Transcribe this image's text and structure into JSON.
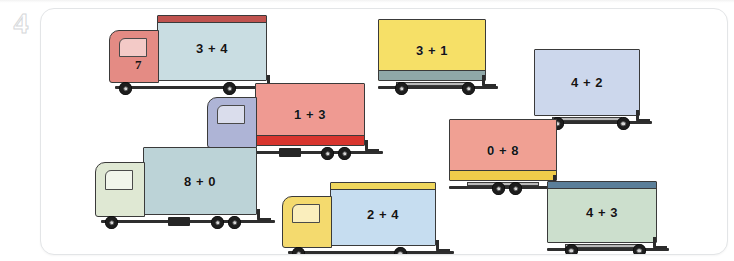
{
  "exercise": {
    "number": "4"
  },
  "worksheet": {
    "title": "Trucks with addition expressions",
    "vehicles": [
      {
        "id": "truck-3-plus-4",
        "kind": "truck",
        "expression": "3 + 4",
        "cab_number": "7",
        "cab_color": "#e48b84",
        "body_color": "#c9dde2",
        "band_color": "#c0534f",
        "band_position": "top",
        "x": 108,
        "y": 14,
        "width": 176,
        "height": 66
      },
      {
        "id": "trailer-3-plus-1",
        "kind": "trailer",
        "expression": "3 + 1",
        "cab_number": "",
        "cab_color": "",
        "body_color": "#f6e067",
        "band_color": "#8fa8a8",
        "band_position": "bottom",
        "x": 377,
        "y": 18,
        "width": 122,
        "height": 62
      },
      {
        "id": "trailer-4-plus-2",
        "kind": "trailer",
        "expression": "4 + 2",
        "cab_number": "",
        "cab_color": "",
        "body_color": "#ccd7ec",
        "band_color": "#9aa6bd",
        "band_position": "none",
        "x": 533,
        "y": 48,
        "width": 120,
        "height": 67
      },
      {
        "id": "truck-1-plus-3",
        "kind": "truck",
        "expression": "1 + 3",
        "cab_number": "",
        "cab_color": "#aeb4d6",
        "body_color": "#ef9a92",
        "band_color": "#d8352e",
        "band_position": "bottom",
        "x": 206,
        "y": 82,
        "width": 176,
        "height": 63
      },
      {
        "id": "trailer-0-plus-8",
        "kind": "trailer",
        "expression": "0 + 8",
        "cab_number": "",
        "cab_color": "",
        "body_color": "#f0a093",
        "band_color": "#f0cc4a",
        "band_position": "bottom",
        "x": 448,
        "y": 118,
        "width": 122,
        "height": 62
      },
      {
        "id": "truck-8-plus-0",
        "kind": "truck",
        "expression": "8 + 0",
        "cab_number": "",
        "cab_color": "#dfe8d3",
        "body_color": "#bcd3d7",
        "band_color": "#6f93a3",
        "band_position": "none",
        "x": 94,
        "y": 146,
        "width": 180,
        "height": 68
      },
      {
        "id": "truck-2-plus-4",
        "kind": "truck",
        "expression": "2 + 4",
        "cab_number": "",
        "cab_color": "#f4da6e",
        "body_color": "#c6ddf0",
        "band_color": "#f0d75d",
        "band_position": "top",
        "x": 281,
        "y": 181,
        "width": 172,
        "height": 64
      },
      {
        "id": "trailer-4-plus-3",
        "kind": "trailer",
        "expression": "4 + 3",
        "cab_number": "",
        "cab_color": "",
        "body_color": "#ccdfcd",
        "band_color": "#5b7f99",
        "band_position": "top",
        "x": 546,
        "y": 180,
        "width": 124,
        "height": 62
      }
    ]
  }
}
